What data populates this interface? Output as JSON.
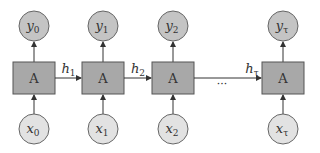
{
  "diagram": {
    "colors": {
      "box_fill": "#a8a8a8",
      "box_stroke": "#555555",
      "output_fill": "#c4c4c4",
      "input_fill": "#e2e2e2",
      "circle_stroke": "#666666",
      "line": "#333333"
    },
    "cells": [
      {
        "box_label": "A",
        "output": {
          "base": "y",
          "sub": "0"
        },
        "input": {
          "base": "x",
          "sub": "0"
        },
        "cx": 34
      },
      {
        "box_label": "A",
        "output": {
          "base": "y",
          "sub": "1"
        },
        "input": {
          "base": "x",
          "sub": "1"
        },
        "cx": 103
      },
      {
        "box_label": "A",
        "output": {
          "base": "y",
          "sub": "2"
        },
        "input": {
          "base": "x",
          "sub": "2"
        },
        "cx": 173
      },
      {
        "box_label": "A",
        "output": {
          "base": "y",
          "sub": "τ"
        },
        "input": {
          "base": "x",
          "sub": "τ"
        },
        "cx": 283
      }
    ],
    "hidden_states": [
      {
        "base": "h",
        "sub": "1"
      },
      {
        "base": "h",
        "sub": "2"
      },
      {
        "base": "h",
        "sub": "τ"
      }
    ],
    "ellipsis": "···"
  }
}
